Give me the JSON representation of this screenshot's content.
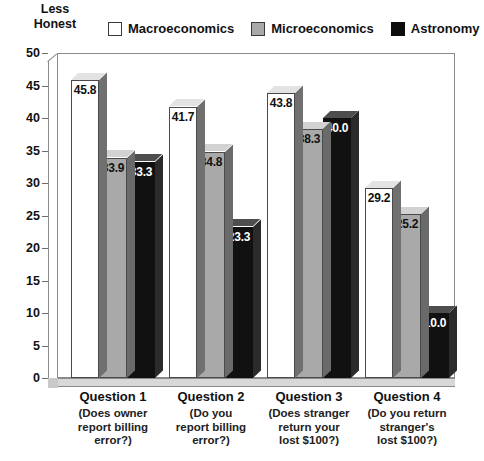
{
  "axis_title": "Less\nHonest",
  "legend": {
    "items": [
      {
        "label": "Macroeconomics",
        "swatch": "white-swatch-icon",
        "color": "#ffffff"
      },
      {
        "label": "Microeconomics",
        "swatch": "gray-swatch-icon",
        "color": "#a9a9a9"
      },
      {
        "label": "Astronomy",
        "swatch": "black-swatch-icon",
        "color": "#111111"
      }
    ]
  },
  "chart_data": {
    "type": "bar",
    "title": "",
    "subtitle": "",
    "xlabel": "",
    "ylabel": "Less Honest",
    "ylim": [
      0,
      50
    ],
    "yticks": [
      0,
      5,
      10,
      15,
      20,
      25,
      30,
      35,
      40,
      45,
      50
    ],
    "ytick_labels": [
      "0",
      "5",
      "10",
      "15",
      "20",
      "25",
      "30",
      "35",
      "40",
      "45",
      "50"
    ],
    "grid": false,
    "legend_position": "top",
    "categories": [
      "Question 1",
      "Question 2",
      "Question 3",
      "Question 4"
    ],
    "category_sublabels": [
      "(Does owner report billing error?)",
      "(Do you report billing error?)",
      "(Does stranger return your lost $100?)",
      "(Do you return stranger's lost $100?)"
    ],
    "category_sublabel_lines": [
      [
        "(Does owner",
        "report billing",
        "error?)"
      ],
      [
        "(Do you",
        "report billing",
        "error?)"
      ],
      [
        "(Does stranger",
        "return your",
        "lost $100?)"
      ],
      [
        "(Do you return",
        "stranger's",
        "lost $100?)"
      ]
    ],
    "series": [
      {
        "name": "Macroeconomics",
        "color": "#ffffff",
        "values": [
          45.8,
          41.7,
          43.8,
          29.2
        ]
      },
      {
        "name": "Microeconomics",
        "color": "#a9a9a9",
        "values": [
          33.9,
          34.8,
          38.3,
          25.2
        ]
      },
      {
        "name": "Astronomy",
        "color": "#111111",
        "values": [
          33.3,
          23.3,
          40.0,
          10.0
        ]
      }
    ],
    "data_labels": [
      [
        "45.8",
        "33.9",
        "33.3"
      ],
      [
        "41.7",
        "34.8",
        "23.3"
      ],
      [
        "43.8",
        "38.3",
        "40.0"
      ],
      [
        "29.2",
        "25.2",
        "10.0"
      ]
    ]
  }
}
